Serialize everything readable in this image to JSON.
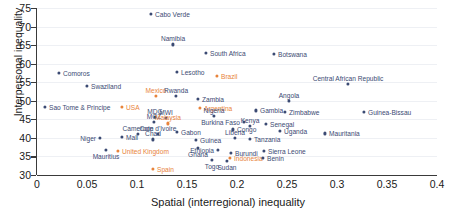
{
  "chart_data": {
    "type": "scatter",
    "title": "",
    "xlabel": "Spatial (interregional) inequality",
    "ylabel": "Interpersonal inequality",
    "xlim": [
      0,
      0.4
    ],
    "ylim": [
      30,
      75
    ],
    "xticks": [
      "0",
      "0.05",
      "0.1",
      "0.15",
      "0.2",
      "0.25",
      "0.3",
      "0.35",
      "0.4"
    ],
    "xtick_values": [
      0,
      0.05,
      0.1,
      0.15,
      0.2,
      0.25,
      0.3,
      0.35,
      0.4
    ],
    "yticks": [
      "30",
      "35",
      "40",
      "45",
      "50",
      "55",
      "60",
      "65",
      "70",
      "75"
    ],
    "ytick_values": [
      30,
      35,
      40,
      45,
      50,
      55,
      60,
      65,
      70,
      75
    ],
    "grid": "horizontal",
    "legend": "none",
    "colors": {
      "point_default": "#3b4a73",
      "point_highlight": "#e8833a",
      "axis": "#3a3a3a",
      "gridline": "#eef0f4",
      "background": "#ffffff"
    },
    "points": [
      {
        "label": "Cabo Verde",
        "x": 0.114,
        "y": 73.3,
        "hi": false,
        "pos": "l"
      },
      {
        "label": "Namibia",
        "x": 0.136,
        "y": 65.2,
        "hi": false,
        "pos": "above"
      },
      {
        "label": "South Africa",
        "x": 0.169,
        "y": 62.8,
        "hi": false,
        "pos": "l"
      },
      {
        "label": "Botswana",
        "x": 0.237,
        "y": 62.6,
        "hi": false,
        "pos": "l"
      },
      {
        "label": "Lesotho",
        "x": 0.14,
        "y": 57.8,
        "hi": false,
        "pos": "l"
      },
      {
        "label": "Comoros",
        "x": 0.022,
        "y": 57.4,
        "hi": false,
        "pos": "l"
      },
      {
        "label": "Brazil",
        "x": 0.18,
        "y": 56.8,
        "hi": true,
        "pos": "l"
      },
      {
        "label": "Central African Republic",
        "x": 0.311,
        "y": 54.6,
        "hi": false,
        "pos": "above"
      },
      {
        "label": "Swaziland",
        "x": 0.05,
        "y": 54.0,
        "hi": false,
        "pos": "l"
      },
      {
        "label": "Mexico",
        "x": 0.119,
        "y": 51.4,
        "hi": true,
        "pos": "above"
      },
      {
        "label": "Rwanda",
        "x": 0.139,
        "y": 51.3,
        "hi": false,
        "pos": "above"
      },
      {
        "label": "Zambia",
        "x": 0.161,
        "y": 50.6,
        "hi": false,
        "pos": "l"
      },
      {
        "label": "Angola",
        "x": 0.252,
        "y": 50.0,
        "hi": false,
        "pos": "above"
      },
      {
        "label": "Sao Tome & Principe",
        "x": 0.008,
        "y": 48.4,
        "hi": false,
        "pos": "l"
      },
      {
        "label": "USA",
        "x": 0.085,
        "y": 48.3,
        "hi": true,
        "pos": "l"
      },
      {
        "label": "Argentina",
        "x": 0.163,
        "y": 48.2,
        "hi": true,
        "pos": "l"
      },
      {
        "label": "Gambia",
        "x": 0.219,
        "y": 47.4,
        "hi": false,
        "pos": "l"
      },
      {
        "label": "Zimbabwe",
        "x": 0.248,
        "y": 47.0,
        "hi": false,
        "pos": "l"
      },
      {
        "label": "Guinea-Bissau",
        "x": 0.327,
        "y": 46.9,
        "hi": false,
        "pos": "l"
      },
      {
        "label": "Nigeria",
        "x": 0.177,
        "y": 46.0,
        "hi": false,
        "pos": "above"
      },
      {
        "label": "MDG",
        "x": 0.118,
        "y": 45.6,
        "hi": false,
        "pos": "above"
      },
      {
        "label": "MWI",
        "x": 0.129,
        "y": 45.3,
        "hi": false,
        "pos": "above"
      },
      {
        "label": "MOZ",
        "x": 0.117,
        "y": 44.2,
        "hi": false,
        "pos": "above"
      },
      {
        "label": "Malaysia",
        "x": 0.131,
        "y": 43.9,
        "hi": true,
        "pos": "above"
      },
      {
        "label": "Burkina Faso",
        "x": 0.207,
        "y": 44.2,
        "hi": false,
        "pos": "r"
      },
      {
        "label": "Senegal",
        "x": 0.229,
        "y": 43.8,
        "hi": false,
        "pos": "l"
      },
      {
        "label": "Kenya",
        "x": 0.213,
        "y": 43.2,
        "hi": false,
        "pos": "above"
      },
      {
        "label": "Gabon",
        "x": 0.14,
        "y": 41.6,
        "hi": false,
        "pos": "l"
      },
      {
        "label": "Congo",
        "x": 0.196,
        "y": 42.3,
        "hi": false,
        "pos": "l"
      },
      {
        "label": "Uganda",
        "x": 0.243,
        "y": 42.0,
        "hi": false,
        "pos": "l"
      },
      {
        "label": "Mauritania",
        "x": 0.288,
        "y": 41.2,
        "hi": false,
        "pos": "l"
      },
      {
        "label": "Cameroon",
        "x": 0.101,
        "y": 41.0,
        "hi": false,
        "pos": "above"
      },
      {
        "label": "Cote d'Ivoire",
        "x": 0.121,
        "y": 41.0,
        "hi": false,
        "pos": "above"
      },
      {
        "label": "Chad",
        "x": 0.116,
        "y": 39.6,
        "hi": false,
        "pos": "above"
      },
      {
        "label": "Mali",
        "x": 0.085,
        "y": 40.2,
        "hi": false,
        "pos": "l"
      },
      {
        "label": "Niger",
        "x": 0.063,
        "y": 39.9,
        "hi": false,
        "pos": "r"
      },
      {
        "label": "Guinea",
        "x": 0.159,
        "y": 39.4,
        "hi": false,
        "pos": "l"
      },
      {
        "label": "Liberia",
        "x": 0.198,
        "y": 40.0,
        "hi": false,
        "pos": "above"
      },
      {
        "label": "Tanzania",
        "x": 0.213,
        "y": 39.8,
        "hi": false,
        "pos": "l"
      },
      {
        "label": "United Kingdom",
        "x": 0.081,
        "y": 36.6,
        "hi": true,
        "pos": "l"
      },
      {
        "label": "Mauritius",
        "x": 0.069,
        "y": 36.7,
        "hi": false,
        "pos": "below"
      },
      {
        "label": "Ghana",
        "x": 0.161,
        "y": 37.2,
        "hi": false,
        "pos": "below"
      },
      {
        "label": "Ethiopia",
        "x": 0.181,
        "y": 36.8,
        "hi": false,
        "pos": "r"
      },
      {
        "label": "Burundi",
        "x": 0.194,
        "y": 36.0,
        "hi": false,
        "pos": "l"
      },
      {
        "label": "Sierra Leone",
        "x": 0.227,
        "y": 36.6,
        "hi": false,
        "pos": "l"
      },
      {
        "label": "Indonesia",
        "x": 0.193,
        "y": 34.6,
        "hi": true,
        "pos": "l"
      },
      {
        "label": "Benin",
        "x": 0.226,
        "y": 34.6,
        "hi": false,
        "pos": "l"
      },
      {
        "label": "Togo",
        "x": 0.175,
        "y": 34.0,
        "hi": false,
        "pos": "below"
      },
      {
        "label": "Sudan",
        "x": 0.19,
        "y": 33.7,
        "hi": false,
        "pos": "below"
      },
      {
        "label": "Spain",
        "x": 0.116,
        "y": 31.6,
        "hi": true,
        "pos": "l"
      }
    ]
  }
}
